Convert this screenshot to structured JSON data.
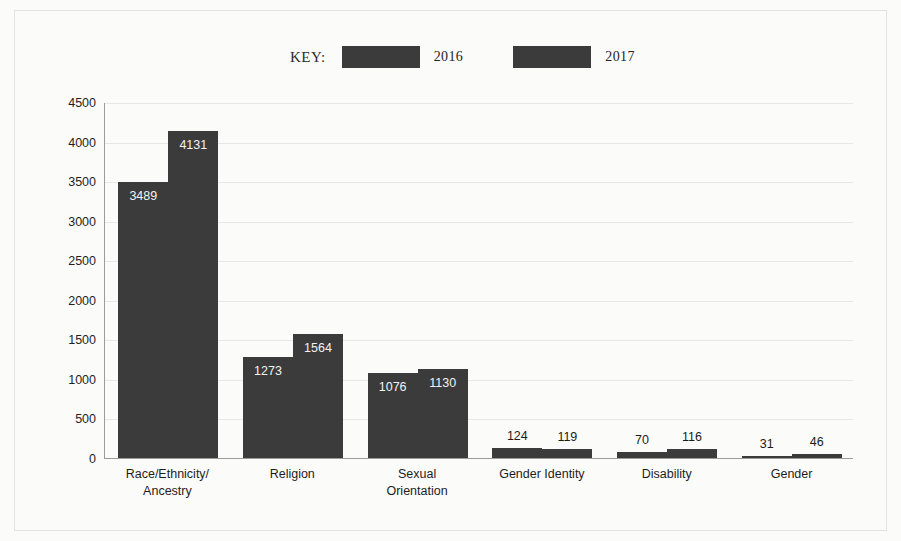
{
  "legend": {
    "key_label": "KEY:",
    "items": [
      {
        "label": "2016",
        "color": "#3b3b3b",
        "swatch_icon": "legend-swatch-2016"
      },
      {
        "label": "2017",
        "color": "#3b3b3b",
        "swatch_icon": "legend-swatch-2017"
      }
    ]
  },
  "axis": {
    "y_ticks": [
      "4500",
      "4000",
      "3500",
      "3000",
      "2500",
      "2000",
      "1500",
      "1000",
      "500",
      "0"
    ]
  },
  "chart_data": {
    "type": "bar",
    "title": "",
    "subtitle": "",
    "xlabel": "",
    "ylabel": "",
    "ylim": [
      0,
      4500
    ],
    "ytick_step": 500,
    "grid": true,
    "legend_position": "top-center",
    "bar_color": "#3b3b3b",
    "categories": [
      "Race/Ethnicity/\nAncestry",
      "Religion",
      "Sexual\nOrientation",
      "Gender Identity",
      "Disability",
      "Gender"
    ],
    "series": [
      {
        "name": "2016",
        "values": [
          3489,
          1273,
          1076,
          124,
          70,
          31
        ]
      },
      {
        "name": "2017",
        "values": [
          4131,
          1564,
          1130,
          119,
          116,
          46
        ]
      }
    ],
    "value_labels": [
      [
        "3489",
        "4131"
      ],
      [
        "1273",
        "1564"
      ],
      [
        "1076",
        "1130"
      ],
      [
        "124",
        "119"
      ],
      [
        "70",
        "116"
      ],
      [
        "31",
        "46"
      ]
    ]
  }
}
